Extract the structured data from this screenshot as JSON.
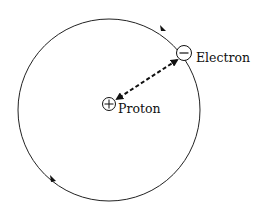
{
  "diagram": {
    "orbit": {
      "cx": 109,
      "cy": 110,
      "r": 91,
      "direction": "counterclockwise"
    },
    "proton": {
      "label": "Proton",
      "symbol": "+",
      "x": 109,
      "y": 104
    },
    "electron": {
      "label": "Electron",
      "symbol": "−",
      "x": 184,
      "y": 53
    },
    "connector": {
      "style": "dashed",
      "arrows": "both"
    },
    "colors": {
      "stroke": "#111111",
      "background": "#ffffff"
    }
  }
}
